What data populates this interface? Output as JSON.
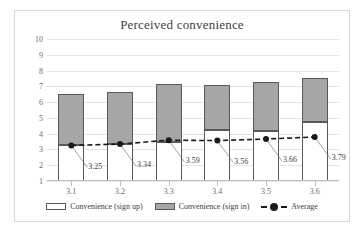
{
  "chart_data": {
    "type": "bar",
    "title": "Perceived convenience",
    "xlabel": "",
    "ylabel": "",
    "ylim": [
      1,
      10
    ],
    "yticks": [
      1,
      2,
      3,
      4,
      5,
      6,
      7,
      8,
      9,
      10
    ],
    "grid": true,
    "stacked": true,
    "legend_position": "bottom",
    "categories": [
      "3.1",
      "3.2",
      "3.3",
      "3.4",
      "3.5",
      "3.6"
    ],
    "series": [
      {
        "name": "Convenience (sign up)",
        "type": "bar",
        "color": "#ffffff",
        "values": [
          3.28,
          3.37,
          3.5,
          4.25,
          4.18,
          4.75
        ]
      },
      {
        "name": "Convenience (sign in)",
        "type": "bar",
        "color": "#a6a6a6",
        "values": [
          3.21,
          3.29,
          3.65,
          2.85,
          3.1,
          2.78
        ]
      },
      {
        "name": "Average",
        "type": "line",
        "color": "#1a1a1a",
        "values": [
          3.25,
          3.34,
          3.59,
          3.56,
          3.66,
          3.79
        ],
        "labels": [
          "3.25",
          "3.34",
          "3.59",
          "3.56",
          "3.66",
          "3.79"
        ]
      }
    ],
    "stack_totals": [
      6.49,
      6.66,
      7.15,
      7.1,
      7.28,
      7.53
    ]
  },
  "legend": {
    "items": [
      {
        "label": "Convenience (sign up)",
        "marker": "white-square"
      },
      {
        "label": "Convenience (sign in)",
        "marker": "gray-square"
      },
      {
        "label": "Average",
        "marker": "dashed-line-dot"
      }
    ]
  }
}
